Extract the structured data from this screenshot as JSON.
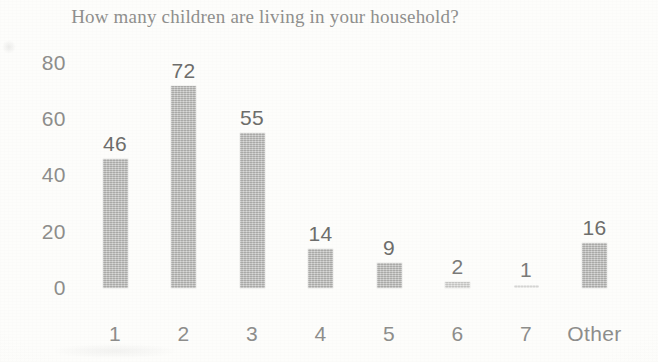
{
  "chart_data": {
    "type": "bar",
    "title": "How many children are living in your household?",
    "xlabel": "",
    "ylabel": "",
    "categories": [
      "1",
      "2",
      "3",
      "4",
      "5",
      "6",
      "7",
      "Other"
    ],
    "values": [
      46,
      72,
      55,
      14,
      9,
      2,
      1,
      16
    ],
    "value_labels": [
      "46",
      "72",
      "55",
      "14",
      "9",
      "2",
      "1",
      "16"
    ],
    "yticks": [
      "80",
      "60",
      "40",
      "20",
      "0"
    ],
    "ytick_values": [
      80,
      60,
      40,
      20,
      0
    ],
    "ylim": [
      0,
      80
    ],
    "grid": false,
    "legend": false,
    "bar_color": "#b9b9b7",
    "text_color": "#8d8d8b",
    "label_color": "#6d6d6b",
    "background_color": "#fdfdfb"
  }
}
